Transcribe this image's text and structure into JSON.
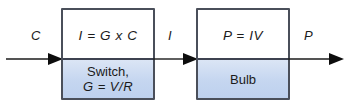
{
  "diagram": {
    "type": "block-flow-diagram",
    "background_color": "#ffffff",
    "box_border_color": "#4a4f5a",
    "band_color": "#c5d6f0",
    "text_color": "#1b1b1b",
    "blocks": [
      {
        "id": "switch",
        "equation": "I = G x C",
        "name": "Switch,",
        "parameter": "G = V/R"
      },
      {
        "id": "bulb",
        "equation": "P = IV",
        "name": "Bulb",
        "parameter": ""
      }
    ],
    "flows": [
      {
        "id": "input",
        "label": "C"
      },
      {
        "id": "middle",
        "label": "I"
      },
      {
        "id": "output",
        "label": "P"
      }
    ]
  }
}
